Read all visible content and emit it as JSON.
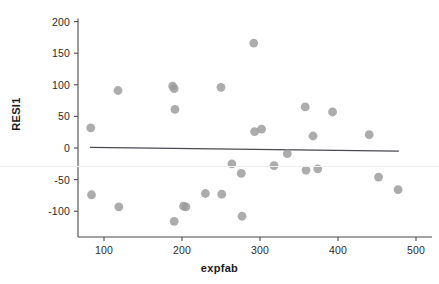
{
  "chart_data": {
    "type": "scatter",
    "title": "",
    "xlabel": "expfab",
    "ylabel": "RESI1",
    "xlim": [
      60,
      500
    ],
    "ylim": [
      -130,
      205
    ],
    "xticks": [
      100,
      200,
      300,
      400,
      500
    ],
    "yticks": [
      200,
      150,
      100,
      50,
      0,
      -50,
      -100
    ],
    "grid": false,
    "legend": null,
    "marker": {
      "shape": "circle",
      "color": "#9a9a9a",
      "size": 4.4
    },
    "reference_line": {
      "label": "fitted regression line",
      "color": "#4a4a50",
      "x_start": 82,
      "y_start": 1,
      "x_end": 478,
      "y_end": -5
    },
    "points": [
      {
        "x": 83,
        "y": 32
      },
      {
        "x": 84,
        "y": -74
      },
      {
        "x": 118,
        "y": 91
      },
      {
        "x": 119,
        "y": -93
      },
      {
        "x": 188,
        "y": 98
      },
      {
        "x": 190,
        "y": 94
      },
      {
        "x": 191,
        "y": 61
      },
      {
        "x": 190,
        "y": -116
      },
      {
        "x": 202,
        "y": -92
      },
      {
        "x": 205,
        "y": -93
      },
      {
        "x": 230,
        "y": -72
      },
      {
        "x": 250,
        "y": 96
      },
      {
        "x": 251,
        "y": -73
      },
      {
        "x": 264,
        "y": -25
      },
      {
        "x": 276,
        "y": -40
      },
      {
        "x": 277,
        "y": -108
      },
      {
        "x": 292,
        "y": 166
      },
      {
        "x": 293,
        "y": 26
      },
      {
        "x": 302,
        "y": 30
      },
      {
        "x": 318,
        "y": -28
      },
      {
        "x": 335,
        "y": -9
      },
      {
        "x": 358,
        "y": 65
      },
      {
        "x": 359,
        "y": -35
      },
      {
        "x": 368,
        "y": 19
      },
      {
        "x": 374,
        "y": -33
      },
      {
        "x": 393,
        "y": 57
      },
      {
        "x": 440,
        "y": 21
      },
      {
        "x": 452,
        "y": -46
      },
      {
        "x": 477,
        "y": -66
      }
    ]
  },
  "axes": {
    "y_tick_labels": [
      "200",
      "150",
      "100",
      "50",
      "0",
      "-50",
      "-100"
    ],
    "x_tick_labels": [
      "100",
      "200",
      "300",
      "400",
      "500"
    ],
    "x_title": "expfab",
    "y_title": "RESI1"
  }
}
